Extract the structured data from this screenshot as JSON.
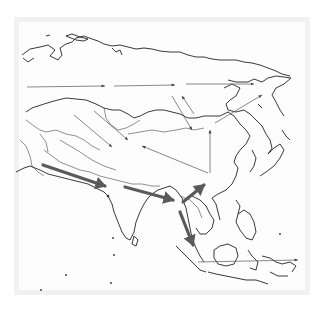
{
  "map": {
    "subject": "Asia outline map with migration/route arrows",
    "region": "Asia",
    "colors": {
      "background": "#ffffff",
      "frame": "#f1f1f1",
      "coastline": "#222222",
      "thin_arrow": "#555555",
      "thick_arrow": "#5a5a5a"
    },
    "thin_routes": [
      {
        "name": "northern-route-west",
        "from": "Western Siberia",
        "to": "Central Siberia"
      },
      {
        "name": "northern-route-middle",
        "from": "Central Siberia",
        "to": "Eastern Siberia"
      },
      {
        "name": "northern-route-east",
        "from": "Eastern Siberia",
        "to": "Far East"
      },
      {
        "name": "central-asia-to-tibet-1",
        "from": "Kazakhstan",
        "to": "Northwest China"
      },
      {
        "name": "central-asia-to-tibet-2",
        "from": "Kazakhstan",
        "to": "Tarim Basin"
      },
      {
        "name": "china-to-mongolia-1",
        "from": "North China",
        "to": "Lake Baikal"
      },
      {
        "name": "china-to-mongolia-2",
        "from": "Lake Baikal",
        "to": "Mongolia"
      },
      {
        "name": "south-china-to-tibet",
        "from": "South China",
        "to": "Tibetan Plateau"
      },
      {
        "name": "south-china-north",
        "from": "South China",
        "to": "North China"
      },
      {
        "name": "china-to-kamchatka",
        "from": "Manchuria",
        "to": "Kamchatka"
      },
      {
        "name": "sunda-to-pacific",
        "from": "Borneo",
        "to": "Pacific"
      }
    ],
    "thick_routes": [
      {
        "name": "southern-route-persia-india",
        "from": "Persia",
        "to": "North India"
      },
      {
        "name": "southern-route-india-burma",
        "from": "Bengal",
        "to": "Burma"
      },
      {
        "name": "southern-route-indochina-china",
        "from": "Indochina",
        "to": "South China"
      },
      {
        "name": "southern-route-malay",
        "from": "Burma",
        "to": "Malay Peninsula"
      }
    ]
  }
}
